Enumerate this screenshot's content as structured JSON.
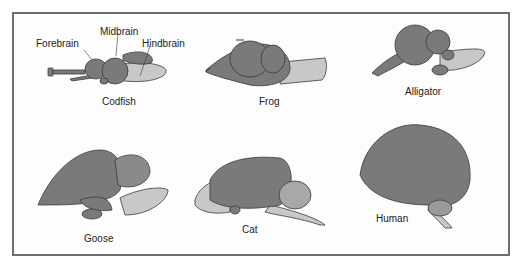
{
  "figure": {
    "colors": {
      "brain_dark": "#7a7a7a",
      "brain_outline": "#3a3a3a",
      "hindbrain_light": "#c8c8c8",
      "frame_border": "#6e6e6e",
      "background": "#fdfdfd"
    },
    "part_labels": {
      "forebrain": "Forebrain",
      "midbrain": "Midbrain",
      "hindbrain": "Hindbrain"
    },
    "species": [
      {
        "name": "Codfish"
      },
      {
        "name": "Frog"
      },
      {
        "name": "Alligator"
      },
      {
        "name": "Goose"
      },
      {
        "name": "Cat"
      },
      {
        "name": "Human"
      }
    ]
  }
}
